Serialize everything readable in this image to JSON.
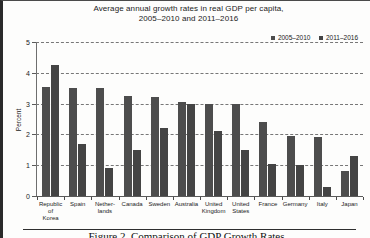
{
  "chart_data": {
    "type": "bar",
    "title": "Average annual growth rates in real GDP per capita, 2005–2010 and 2011–2016",
    "title_line1": "Average annual growth rates in real GDP per capita,",
    "title_line2": "2005–2010 and 2011–2016",
    "xlabel": "",
    "ylabel": "Percent",
    "ylim": [
      0,
      5
    ],
    "yticks": [
      0,
      1,
      2,
      3,
      4,
      5
    ],
    "ytick_labels": [
      "0",
      "1",
      "2",
      "3",
      "4",
      "5"
    ],
    "grid": true,
    "legend_position": "top-right",
    "categories": [
      "Republic of Korea",
      "Spain",
      "Netherlands",
      "Canada",
      "Sweden",
      "Australia",
      "United Kingdom",
      "United States",
      "France",
      "Germany",
      "Italy",
      "Japan"
    ],
    "category_lines": [
      [
        "Republic of",
        "Korea"
      ],
      [
        "Spain",
        ""
      ],
      [
        "Nether-",
        "lands"
      ],
      [
        "Canada",
        ""
      ],
      [
        "Sweden",
        ""
      ],
      [
        "Australia",
        ""
      ],
      [
        "United",
        "Kingdom"
      ],
      [
        "United",
        "States"
      ],
      [
        "France",
        ""
      ],
      [
        "Germany",
        ""
      ],
      [
        "Italy",
        ""
      ],
      [
        "Japan",
        ""
      ]
    ],
    "series": [
      {
        "name": "2005–2010",
        "color": "#4d4d4d",
        "values": [
          3.55,
          3.5,
          3.5,
          3.25,
          3.2,
          3.05,
          3.0,
          3.0,
          2.4,
          1.95,
          1.9,
          0.8
        ]
      },
      {
        "name": "2011–2016",
        "color": "#444444",
        "values": [
          4.25,
          1.7,
          0.9,
          1.5,
          2.2,
          3.0,
          2.1,
          1.5,
          1.05,
          1.0,
          0.3,
          1.3
        ]
      }
    ]
  },
  "figure": {
    "caption": "Figure 2. Comparison of GDP Growth Rates"
  }
}
